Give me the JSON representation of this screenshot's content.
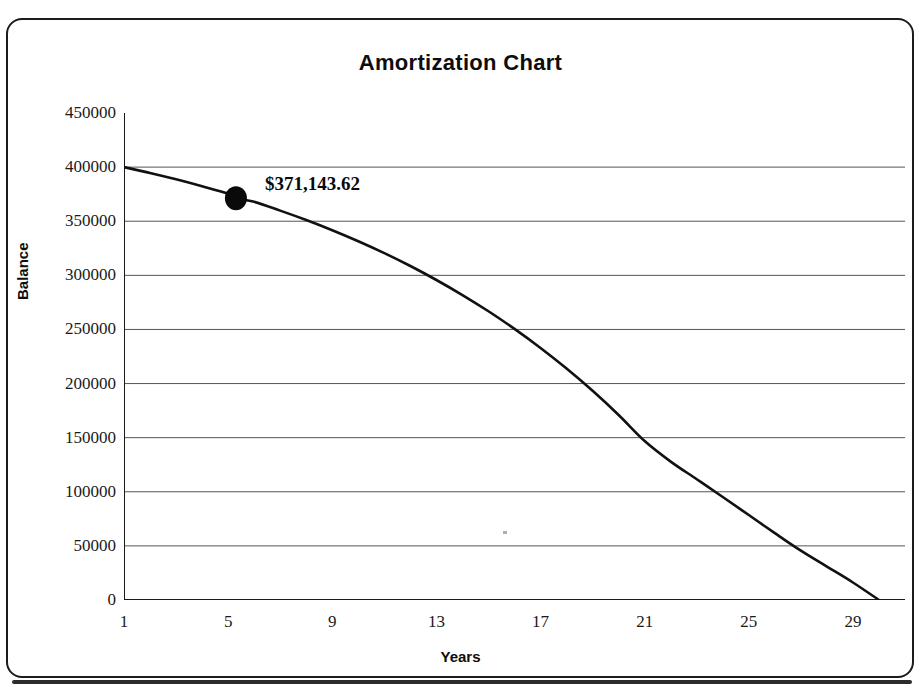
{
  "chart_data": {
    "type": "line",
    "title": "Amortization Chart",
    "xlabel": "Years",
    "ylabel": "Balance",
    "xlim": [
      1,
      31
    ],
    "ylim": [
      0,
      450000
    ],
    "grid": true,
    "legend": "none",
    "x_tick_labels": [
      "1",
      "5",
      "9",
      "13",
      "17",
      "21",
      "25",
      "29"
    ],
    "x_tick_values": [
      1,
      5,
      9,
      13,
      17,
      21,
      25,
      29
    ],
    "x_minor_tick_step": 1,
    "y_tick_labels": [
      "0",
      "50000",
      "100000",
      "150000",
      "200000",
      "250000",
      "300000",
      "350000",
      "400000",
      "450000"
    ],
    "y_tick_values": [
      0,
      50000,
      100000,
      150000,
      200000,
      250000,
      300000,
      350000,
      400000,
      450000
    ],
    "series": [
      {
        "name": "Loan Balance",
        "color": "#111111",
        "x": [
          1,
          2,
          3,
          4,
          5,
          5.3,
          6,
          7,
          8,
          9,
          10,
          11,
          12,
          13,
          14,
          15,
          16,
          17,
          18,
          19,
          20,
          21,
          22,
          23,
          24,
          25,
          26,
          27,
          28,
          29,
          30
        ],
        "values": [
          400000,
          394600,
          388700,
          382300,
          375400,
          371144,
          367900,
          359800,
          351100,
          341700,
          331500,
          320500,
          308600,
          295700,
          281800,
          266800,
          250500,
          232900,
          213900,
          193300,
          171000,
          146900,
          127900,
          111600,
          95200,
          78500,
          61800,
          45600,
          30900,
          16200,
          0
        ]
      }
    ],
    "annotations": [
      {
        "name": "balance-marker",
        "text": "$371,143.62",
        "x": 5.3,
        "y": 371143.62,
        "marker": "filled-circle",
        "marker_color": "#0a0a0a"
      }
    ]
  },
  "axes": {
    "y_ticks": [
      {
        "label": "450000",
        "value": 450000
      },
      {
        "label": "400000",
        "value": 400000
      },
      {
        "label": "350000",
        "value": 350000
      },
      {
        "label": "300000",
        "value": 300000
      },
      {
        "label": "250000",
        "value": 250000
      },
      {
        "label": "200000",
        "value": 200000
      },
      {
        "label": "150000",
        "value": 150000
      },
      {
        "label": "100000",
        "value": 100000
      },
      {
        "label": "50000",
        "value": 50000
      },
      {
        "label": "0",
        "value": 0
      }
    ],
    "x_ticks": [
      {
        "label": "1",
        "value": 1
      },
      {
        "label": "5",
        "value": 5
      },
      {
        "label": "9",
        "value": 9
      },
      {
        "label": "13",
        "value": 13
      },
      {
        "label": "17",
        "value": 17
      },
      {
        "label": "21",
        "value": 21
      },
      {
        "label": "25",
        "value": 25
      },
      {
        "label": "29",
        "value": 29
      }
    ]
  },
  "colors": {
    "line": "#111111",
    "grid": "#555555",
    "axis": "#1a1a1a",
    "frame": "#1c1c1c",
    "text": "#0d0d0d",
    "background": "#ffffff"
  }
}
